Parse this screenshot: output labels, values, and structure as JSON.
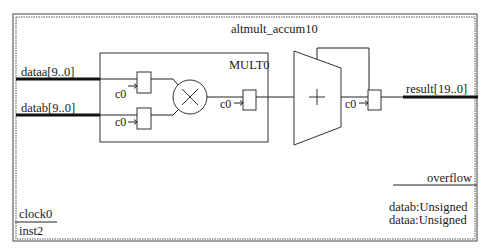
{
  "block": {
    "title": "altmult_accum10",
    "instance": "inst2"
  },
  "inputs": {
    "dataa": "dataa[9..0]",
    "datab": "datab[9..0]",
    "clock": "clock0"
  },
  "outputs": {
    "result": "result[19..0]",
    "overflow": "overflow"
  },
  "multiplier": {
    "label": "MULT0",
    "symbol": "multiply-icon"
  },
  "adder": {
    "symbol": "plus-icon"
  },
  "registers": [
    {
      "clock_label": "c0"
    },
    {
      "clock_label": "c0"
    },
    {
      "clock_label": "c0"
    },
    {
      "clock_label": "c0"
    }
  ],
  "params": [
    "datab:Unsigned",
    "dataa:Unsigned"
  ],
  "colors": {
    "line": "#1a1a1a",
    "background": "#ffffff",
    "border": "#555555"
  }
}
